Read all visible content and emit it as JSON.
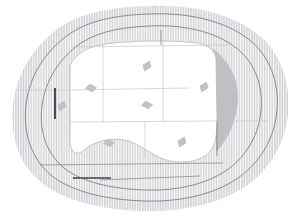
{
  "drawing": {
    "title": "Architectural Site Plan",
    "type": "site-plan",
    "canvas": {
      "width": 301,
      "height": 217
    },
    "background_color": "#ffffff"
  },
  "colors": {
    "hatch_line": "#b9b9bd",
    "hatch_line_dense": "#a6a6ac",
    "contour_line": "#6b6b73",
    "grid_line": "#c2c2c8",
    "building_fill": "#ffffff",
    "shadow_wedge": "#bdbdc2",
    "marker_fill": "#c0c0c6",
    "scale_bar": "#3a3a3f",
    "wall_bar": "#4a4a50",
    "terrain_fill": "#f3f3f5"
  },
  "site_boundary": {
    "name": "outer-terrain-blob",
    "path": "M 150 6 C 196 4 238 16 262 38 C 284 58 290 88 288 112 C 286 140 272 168 246 186 C 218 205 178 212 144 211 C 106 210 66 202 42 183 C 18 164 10 134 13 106 C 16 76 32 46 62 26 C 88 10 120 7 150 6 Z"
  },
  "contours": [
    {
      "name": "contour-outer",
      "path": "M 150 14 C 192 12 231 23 253 43 C 273 61 279 88 277 110 C 275 136 262 161 238 178 C 212 196 176 202 145 201 C 110 200 74 193 52 176 C 30 158 23 131 26 105 C 29 78 44 51 71 33 C 94 18 123 15 150 14"
    },
    {
      "name": "contour-mid",
      "path": "M 150 26 C 188 24 222 34 241 52 C 258 68 263 91 261 111 C 259 133 248 155 227 170 C 204 186 172 191 145 190 C 114 189 83 183 64 168 C 45 152 39 129 42 106 C 45 82 58 59 81 43 C 101 30 126 27 150 26"
    }
  ],
  "building": {
    "name": "main-building-footprint",
    "outline": "M 70 66 C 74 56 84 48 100 45 C 120 41 160 40 188 42 C 205 43 214 48 216 58 L 217 122 C 217 140 214 150 205 156 C 196 162 180 164 166 160 C 152 156 140 143 124 140 C 108 137 92 143 84 150 C 76 157 70 152 70 140 Z",
    "grid_lines": [
      {
        "name": "grid-vertical-1",
        "x1": 103,
        "y1": 44,
        "x2": 103,
        "y2": 122
      },
      {
        "name": "grid-vertical-2",
        "x1": 163,
        "y1": 41,
        "x2": 163,
        "y2": 122
      },
      {
        "name": "grid-vertical-3",
        "x1": 145,
        "y1": 122,
        "x2": 145,
        "y2": 158
      },
      {
        "name": "grid-horizontal-1",
        "x1": 70,
        "y1": 90,
        "x2": 189,
        "y2": 88
      },
      {
        "name": "grid-horizontal-2",
        "x1": 70,
        "y1": 122,
        "x2": 217,
        "y2": 121
      },
      {
        "name": "grid-horizontal-long-1",
        "x1": 18,
        "y1": 90,
        "x2": 70,
        "y2": 90
      },
      {
        "name": "grid-horizontal-long-2",
        "x1": 217,
        "y1": 121,
        "x2": 268,
        "y2": 121
      },
      {
        "name": "grid-horizontal-long-3",
        "x1": 72,
        "y1": 47,
        "x2": 230,
        "y2": 45
      }
    ]
  },
  "shadow_wedge": {
    "name": "east-shadow-wedge",
    "path": "M 212 48 C 226 58 238 76 238 96 C 238 116 230 138 216 152 C 216 140 217 122 217 100 L 216 58 Z"
  },
  "markers": [
    {
      "name": "plan-marker-1",
      "cx": 147,
      "cy": 66,
      "label": "marker-north-center"
    },
    {
      "name": "plan-marker-2",
      "cx": 91,
      "cy": 88,
      "label": "marker-west-upper"
    },
    {
      "name": "plan-marker-3",
      "cx": 204,
      "cy": 87,
      "label": "marker-east-upper"
    },
    {
      "name": "plan-marker-4",
      "cx": 147,
      "cy": 105,
      "label": "marker-center"
    },
    {
      "name": "plan-marker-5",
      "cx": 62,
      "cy": 106,
      "label": "marker-west-edge"
    },
    {
      "name": "plan-marker-6",
      "cx": 109,
      "cy": 143,
      "label": "marker-south-west"
    },
    {
      "name": "plan-marker-7",
      "cx": 182,
      "cy": 142,
      "label": "marker-south-east"
    }
  ],
  "annotations": {
    "scale_bar": {
      "name": "scale-bar",
      "x": 73,
      "y": 177,
      "width": 38,
      "height": 2
    },
    "west_wall": {
      "name": "west-wall-bar",
      "x": 54,
      "y": 88,
      "width": 2,
      "height": 31
    },
    "north_drop_line": {
      "name": "north-drop-line",
      "x1": 161,
      "y1": 30,
      "x2": 161,
      "y2": 45
    },
    "east_drop_line": {
      "name": "east-drop-line",
      "x1": 217,
      "y1": 121,
      "x2": 217,
      "y2": 156
    },
    "south_guide_line": {
      "name": "south-guide-line",
      "x1": 40,
      "y1": 165,
      "x2": 223,
      "y2": 163
    },
    "south_guide_line_2": {
      "name": "south-guide-line-2",
      "x1": 100,
      "y1": 180,
      "x2": 200,
      "y2": 176
    }
  },
  "hatch": {
    "name": "vertical-line-hatch",
    "spacing_px": 1.6,
    "stroke_width": 0.6,
    "description": "vertical line hatch fill over terrain ring"
  }
}
